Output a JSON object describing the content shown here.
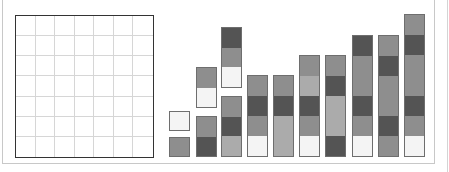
{
  "colors": {
    "dark": "#545454",
    "grey": "#8e8e8e",
    "light": "#ababab",
    "white": "#f4f4f4",
    "border": "#6e6e6e",
    "grid_line": "#d6d6d6",
    "grid_border": "#333333"
  },
  "grid": {
    "rows": 7,
    "cols": 7
  },
  "cell_height": 20.4,
  "baseline_y": 157,
  "bars": [
    {
      "x": 169,
      "blocks": [
        {
          "bottom_offset": 0,
          "cells": [
            "grey"
          ]
        },
        {
          "bottom_offset": 26,
          "cells": [
            "white"
          ]
        }
      ]
    },
    {
      "x": 196,
      "blocks": [
        {
          "bottom_offset": 0,
          "cells": [
            "grey",
            "dark"
          ]
        },
        {
          "bottom_offset": 49,
          "cells": [
            "grey",
            "white"
          ]
        }
      ]
    },
    {
      "x": 221,
      "blocks": [
        {
          "bottom_offset": 0,
          "cells": [
            "grey",
            "dark",
            "light"
          ]
        },
        {
          "bottom_offset": 69,
          "cells": [
            "dark",
            "grey",
            "white"
          ]
        }
      ]
    },
    {
      "x": 247,
      "blocks": [
        {
          "bottom_offset": 0,
          "cells": [
            "grey",
            "dark",
            "grey",
            "white"
          ]
        }
      ]
    },
    {
      "x": 273,
      "blocks": [
        {
          "bottom_offset": 0,
          "cells": [
            "grey",
            "dark",
            "light",
            "light"
          ]
        }
      ]
    },
    {
      "x": 299,
      "blocks": [
        {
          "bottom_offset": 0,
          "cells": [
            "grey",
            "light",
            "dark",
            "grey",
            "white"
          ]
        }
      ]
    },
    {
      "x": 325,
      "blocks": [
        {
          "bottom_offset": 0,
          "cells": [
            "grey",
            "dark",
            "light",
            "light",
            "dark"
          ]
        }
      ]
    },
    {
      "x": 352,
      "blocks": [
        {
          "bottom_offset": 0,
          "cells": [
            "dark",
            "grey",
            "grey",
            "dark",
            "grey",
            "white"
          ]
        }
      ]
    },
    {
      "x": 378,
      "blocks": [
        {
          "bottom_offset": 0,
          "cells": [
            "grey",
            "dark",
            "grey",
            "grey",
            "dark",
            "grey"
          ]
        }
      ]
    },
    {
      "x": 404,
      "blocks": [
        {
          "bottom_offset": 0,
          "cells": [
            "grey",
            "dark",
            "grey",
            "grey",
            "dark",
            "grey",
            "white"
          ]
        }
      ]
    }
  ]
}
